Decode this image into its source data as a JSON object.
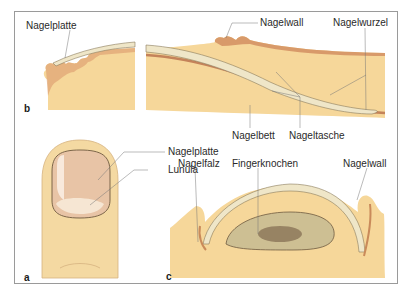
{
  "figure": {
    "panels": {
      "a": {
        "letter": "a",
        "labels": {
          "nail_plate": "Nagelplatte",
          "lunula": "Lunula"
        }
      },
      "b": {
        "letter": "b",
        "labels": {
          "nail_plate": "Nagelplatte",
          "nail_wall": "Nagelwall",
          "nail_root": "Nagelwurzel",
          "nail_bed": "Nagelbett",
          "nail_pocket": "Nageltasche"
        }
      },
      "c": {
        "letter": "c",
        "labels": {
          "nail_fold": "Nagelfalz",
          "finger_bone": "Fingerknochen",
          "nail_wall": "Nagelwall"
        }
      }
    },
    "colors": {
      "tissue": "#f6d79a",
      "tissue_dark": "#e9bf78",
      "nail": "#efe6c8",
      "skin_edge": "#c98a5a",
      "bone": "#cdbf93",
      "finger": "#f4d9a2",
      "nail_plate_pink": "#e8c4a6",
      "line": "#777777"
    }
  }
}
